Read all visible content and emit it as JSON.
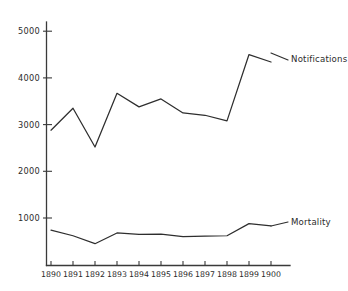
{
  "chart_data": {
    "type": "line",
    "title": "",
    "xlabel": "",
    "ylabel": "",
    "categories": [
      "1890",
      "1891",
      "1892",
      "1893",
      "1894",
      "1895",
      "1896",
      "1897",
      "1898",
      "1899",
      "1900"
    ],
    "x": [
      1890,
      1891,
      1892,
      1893,
      1894,
      1895,
      1896,
      1897,
      1898,
      1899,
      1900
    ],
    "series": [
      {
        "name": "Notifications",
        "values": [
          2880,
          3350,
          2520,
          3670,
          3380,
          3550,
          3250,
          3200,
          3080,
          4500,
          4340
        ]
      },
      {
        "name": "Mortality",
        "values": [
          740,
          620,
          450,
          680,
          650,
          655,
          600,
          610,
          620,
          880,
          830
        ]
      }
    ],
    "ylim": [
      0,
      5300
    ],
    "xlim": [
      1890,
      1900
    ],
    "yticks": [
      1000,
      2000,
      3000,
      4000,
      5000
    ],
    "ytick_labels": [
      "1000",
      "2000",
      "3000",
      "4000",
      "5000"
    ],
    "grid": false,
    "legend_position": "inline-right-of-line-end",
    "annotations": [
      {
        "text": "Notifications",
        "target_year": 1900
      },
      {
        "text": "Mortality",
        "target_year": 1900
      }
    ]
  },
  "labels": {
    "notifications": "Notifications",
    "mortality": "Mortality"
  },
  "yticks": {
    "t0": "1000",
    "t1": "2000",
    "t2": "3000",
    "t3": "4000",
    "t4": "5000"
  },
  "xticks": {
    "x0": "1890",
    "x1": "1891",
    "x2": "1892",
    "x3": "1893",
    "x4": "1894",
    "x5": "1895",
    "x6": "1896",
    "x7": "1897",
    "x8": "1898",
    "x9": "1899",
    "x10": "1900"
  },
  "colors": {
    "ink": "#2e2e2e",
    "axis": "#3a3a3a",
    "background": "#ffffff"
  }
}
